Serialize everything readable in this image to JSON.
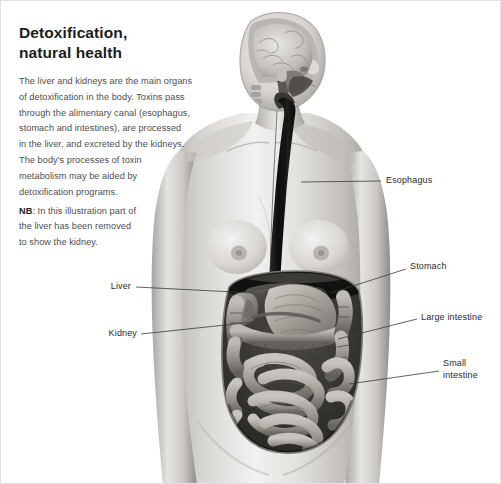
{
  "page": {
    "background_color": "#ffffff",
    "border_color": "#e2e2e2",
    "width": 501,
    "height": 484
  },
  "article": {
    "title": "Detoxification,\nnatural health",
    "body": "The liver and kidneys are the main organs\nof detoxification in the body. Toxins pass\nthrough the alimentary canal (esophagus,\nstomach and intestines), are processed\nin the liver, and excreted by the kidneys.\nThe body's processes of toxin\nmetabolism may be aided by\ndetoxification programs.",
    "note_label": "NB",
    "note_text": ": In this illustration part of\nthe liver has been removed\nto show the kidney.",
    "title_color": "#1c1c1c",
    "body_color": "#4e4e4e"
  },
  "illustration": {
    "name": "female-anatomy-digestive-system",
    "description": "Grayscale medical illustration of a female figure, head shown in sagittal section revealing the brain, with a dark esophagus descending into an opened abdomen exposing the stomach, liver, kidney, large intestine and small intestine.",
    "palette": {
      "skin_light": "#efeeec",
      "skin_mid": "#c9c6c2",
      "skin_shadow": "#9a9792",
      "organ_light": "#bcb8b3",
      "organ_mid": "#8e8a85",
      "organ_dark": "#5e5b57",
      "esophagus_dark": "#141414",
      "outline": "#6e6b67"
    }
  },
  "callouts": [
    {
      "id": "esophagus",
      "label": "Esophagus",
      "side": "right",
      "label_x": 385,
      "label_y": 174,
      "line_from_x": 300,
      "line_from_y": 181,
      "line_to_x": 380,
      "line_to_y": 180
    },
    {
      "id": "stomach",
      "label": "Stomach",
      "side": "right",
      "label_x": 409,
      "label_y": 260,
      "line_from_x": 330,
      "line_from_y": 292,
      "line_to_x": 405,
      "line_to_y": 268
    },
    {
      "id": "large-intestine",
      "label": "Large intestine",
      "side": "right",
      "label_x": 420,
      "label_y": 311,
      "line_from_x": 337,
      "line_from_y": 338,
      "line_to_x": 416,
      "line_to_y": 318
    },
    {
      "id": "small-intestine",
      "label": "Small\nintestine",
      "side": "right",
      "label_x": 442,
      "label_y": 357,
      "line_from_x": 348,
      "line_from_y": 383,
      "line_to_x": 438,
      "line_to_y": 370
    },
    {
      "id": "liver",
      "label": "Liver",
      "side": "left",
      "label_x": 108,
      "label_y": 280,
      "line_from_x": 253,
      "line_from_y": 292,
      "line_to_x": 135,
      "line_to_y": 286
    },
    {
      "id": "kidney",
      "label": "Kidney",
      "side": "left",
      "label_x": 101,
      "label_y": 327,
      "line_from_x": 252,
      "line_from_y": 321,
      "line_to_x": 140,
      "line_to_y": 333
    }
  ]
}
